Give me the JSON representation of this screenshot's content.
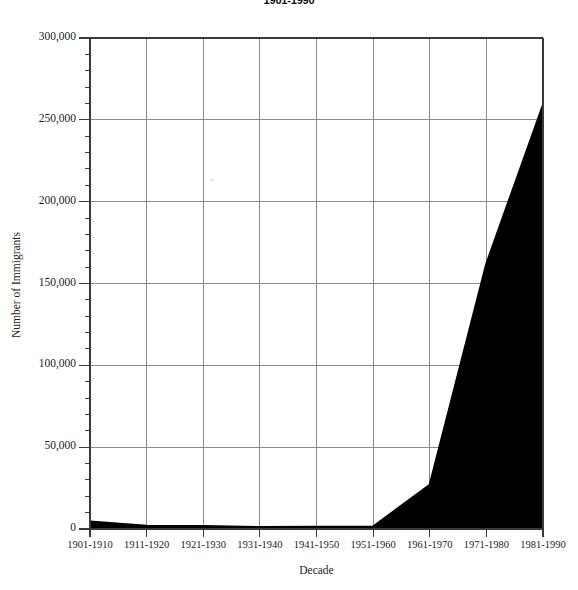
{
  "chart_data": {
    "type": "area",
    "title": "1901-1990",
    "xlabel": "Decade",
    "ylabel": "Number of Immigrants",
    "categories": [
      "1901-1910",
      "1911-1920",
      "1921-1930",
      "1931-1940",
      "1941-1950",
      "1951-1960",
      "1961-1970",
      "1971-1980",
      "1981-1990"
    ],
    "values": [
      4500,
      2000,
      1800,
      1100,
      1300,
      1500,
      27000,
      162000,
      259000
    ],
    "ylim": [
      0,
      300000
    ],
    "ytick_values": [
      0,
      50000,
      100000,
      150000,
      200000,
      250000,
      300000
    ],
    "ytick_labels": [
      "0",
      "50,000",
      "100,000",
      "150,000",
      "200,000",
      "250,000",
      "300,000"
    ],
    "yminor_interval": 10000,
    "grid": true,
    "grid_axis": "x",
    "legend": "none",
    "fill_color": "#000000",
    "line_color": "#000000",
    "axis_color": "#3a3a3a",
    "grid_color": "#8a8a8a",
    "background_color": "#ffffff"
  },
  "chart": {
    "title": "1901-1990",
    "y_axis_title": "Number of Immigrants",
    "x_axis_title": "Decade"
  }
}
